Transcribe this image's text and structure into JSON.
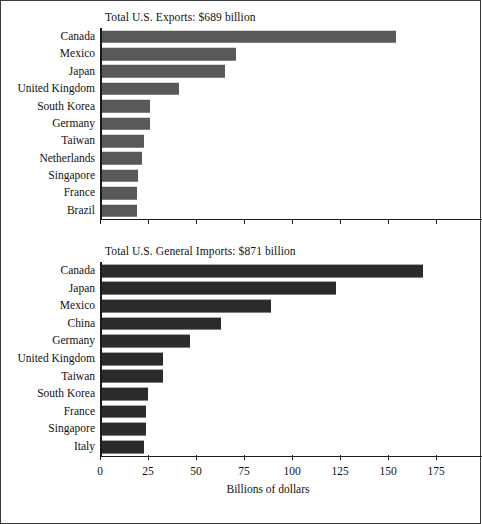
{
  "figure": {
    "background_color": "#ffffff",
    "border_color": "#3a3a3a"
  },
  "chart_data": [
    {
      "type": "bar",
      "orientation": "horizontal",
      "id": "exports",
      "title": "Total U.S. Exports: $689 billion",
      "xlabel": "",
      "ylabel": "",
      "xlim": [
        0,
        175
      ],
      "xticks": [
        0,
        25,
        50,
        75,
        100,
        125,
        150,
        175
      ],
      "xticklabels": [
        "",
        "",
        "",
        "",
        "",
        "",
        "",
        ""
      ],
      "grid": false,
      "legend": false,
      "bar_color": "#595959",
      "categories": [
        "Canada",
        "Mexico",
        "Japan",
        "United Kingdom",
        "South Korea",
        "Germany",
        "Taiwan",
        "Netherlands",
        "Singapore",
        "France",
        "Brazil"
      ],
      "values": [
        153,
        70,
        64,
        40,
        25,
        25,
        22,
        21,
        19,
        18,
        18
      ]
    },
    {
      "type": "bar",
      "orientation": "horizontal",
      "id": "imports",
      "title": "Total U.S. General Imports: $871 billion",
      "xlabel": "Billions of dollars",
      "ylabel": "",
      "xlim": [
        0,
        175
      ],
      "xticks": [
        0,
        25,
        50,
        75,
        100,
        125,
        150,
        175
      ],
      "xticklabels": [
        "0",
        "25",
        "50",
        "75",
        "100",
        "125",
        "150",
        "175"
      ],
      "grid": false,
      "legend": false,
      "bar_color": "#2b2b2b",
      "categories": [
        "Canada",
        "Japan",
        "Mexico",
        "China",
        "Germany",
        "United Kingdom",
        "Taiwan",
        "South Korea",
        "France",
        "Singapore",
        "Italy"
      ],
      "values": [
        167,
        122,
        88,
        62,
        46,
        32,
        32,
        24,
        23,
        23,
        22
      ]
    }
  ]
}
